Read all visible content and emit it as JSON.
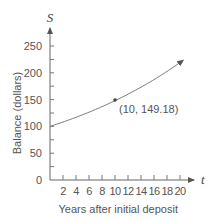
{
  "chart_data": {
    "type": "line",
    "title": "",
    "xlabel": "Years after initial deposit",
    "ylabel": "Balance (dollars)",
    "x_axis_var": "t",
    "y_axis_var": "S",
    "xlim": [
      0,
      21
    ],
    "ylim": [
      0,
      270
    ],
    "x_ticks": [
      2,
      4,
      6,
      8,
      10,
      12,
      14,
      16,
      18,
      20
    ],
    "y_ticks": [
      0,
      50,
      100,
      150,
      200,
      250
    ],
    "grid": false,
    "legend": null,
    "series": [
      {
        "name": "Balance",
        "x": [
          0,
          2,
          4,
          6,
          8,
          10,
          12,
          14,
          16,
          18,
          20,
          20.5
        ],
        "values": [
          100,
          108.16,
          116.99,
          126.53,
          136.86,
          149.18,
          160.1,
          173.17,
          187.3,
          202.58,
          219.11,
          223.5
        ]
      }
    ],
    "annotations": [
      {
        "x": 10,
        "y": 149.18,
        "text": "(10, 149.18)"
      }
    ]
  },
  "labels": {
    "x_ticks": [
      "2",
      "4",
      "6",
      "8",
      "10",
      "12",
      "14",
      "16",
      "18",
      "20"
    ],
    "y_ticks": [
      "0",
      "50",
      "100",
      "150",
      "200",
      "250"
    ],
    "xlabel": "Years after initial deposit",
    "ylabel": "Balance (dollars)",
    "x_var": "t",
    "y_var": "S",
    "point_label": "(10, 149.18)"
  }
}
